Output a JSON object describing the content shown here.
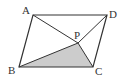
{
  "figure": {
    "type": "parallelogram-with-interior-point",
    "points": {
      "A": {
        "label": "A",
        "x": 33,
        "y": 15
      },
      "D": {
        "label": "D",
        "x": 107,
        "y": 15
      },
      "B": {
        "label": "B",
        "x": 19,
        "y": 67
      },
      "C": {
        "label": "C",
        "x": 93,
        "y": 67
      },
      "P": {
        "label": "P",
        "x": 78,
        "y": 43
      }
    },
    "shaded_region": "triangle PBC",
    "colors": {
      "stroke": "#333333",
      "shade": "#cccccc",
      "background": "#ffffff"
    }
  }
}
